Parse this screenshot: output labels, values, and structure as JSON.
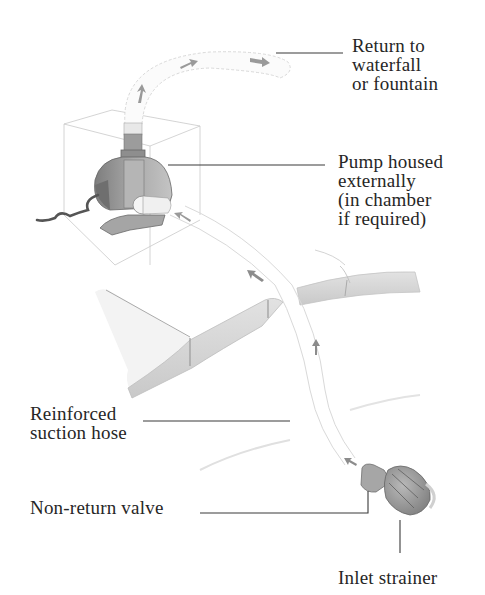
{
  "diagram": {
    "labels": {
      "return": [
        "Return to",
        "waterfall",
        "or fountain"
      ],
      "pump": [
        "Pump housed",
        "externally",
        "(in chamber",
        "if required)"
      ],
      "hose": [
        "Reinforced",
        "suction hose"
      ],
      "valve": [
        "Non-return valve"
      ],
      "strainer": [
        "Inlet strainer"
      ]
    },
    "components": [
      {
        "id": "return-hose",
        "label": "Return to waterfall or fountain"
      },
      {
        "id": "pump",
        "label": "Pump housed externally (in chamber if required)"
      },
      {
        "id": "suction-hose",
        "label": "Reinforced suction hose"
      },
      {
        "id": "non-return-valve",
        "label": "Non-return valve"
      },
      {
        "id": "inlet-strainer",
        "label": "Inlet strainer"
      }
    ],
    "flow_direction": "inlet strainer → non-return valve → suction hose → pump → return hose → waterfall/fountain",
    "colors": {
      "text": "#262626",
      "leader_line": "#3a3a3a",
      "sketch_line": "#b8b8b8",
      "pump_body": "#9a9a9a",
      "pond_edge": "#d6d6d6"
    }
  }
}
